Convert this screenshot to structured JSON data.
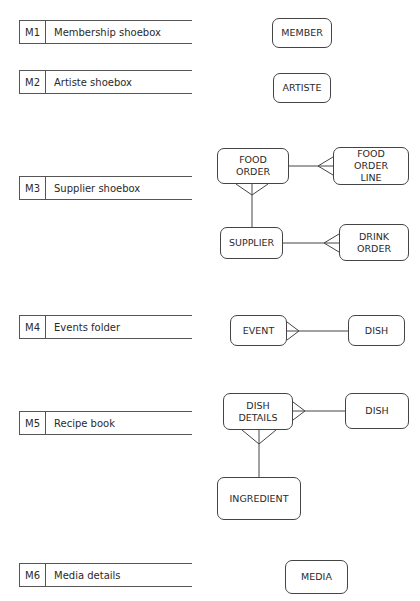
{
  "sources": [
    {
      "code": "M1",
      "label": "Membership shoebox"
    },
    {
      "code": "M2",
      "label": "Artiste shoebox"
    },
    {
      "code": "M3",
      "label": "Supplier shoebox"
    },
    {
      "code": "M4",
      "label": "Events folder"
    },
    {
      "code": "M5",
      "label": "Recipe book"
    },
    {
      "code": "M6",
      "label": "Media details"
    }
  ],
  "entities": {
    "member": "MEMBER",
    "artiste": "ARTISTE",
    "food_order": "FOOD ORDER",
    "food_order_line": "FOOD ORDER LINE",
    "supplier": "SUPPLIER",
    "drink_order": "DRINK ORDER",
    "event": "EVENT",
    "dish_m4": "DISH",
    "dish_details": "DISH DETAILS",
    "dish_m5": "DISH",
    "ingredient": "INGREDIENT",
    "media": "MEDIA"
  },
  "relationships": [
    {
      "from": "FOOD ORDER",
      "to": "FOOD ORDER LINE",
      "many_end": "FOOD ORDER LINE"
    },
    {
      "from": "SUPPLIER",
      "to": "FOOD ORDER",
      "many_end": "FOOD ORDER"
    },
    {
      "from": "SUPPLIER",
      "to": "DRINK ORDER",
      "many_end": "DRINK ORDER"
    },
    {
      "from": "DISH",
      "to": "EVENT",
      "many_end": "EVENT"
    },
    {
      "from": "DISH",
      "to": "DISH DETAILS",
      "many_end": "DISH DETAILS"
    },
    {
      "from": "INGREDIENT",
      "to": "DISH DETAILS",
      "many_end": "DISH DETAILS"
    }
  ]
}
